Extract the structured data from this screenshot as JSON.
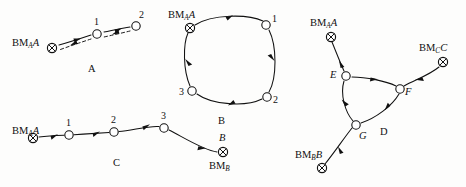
{
  "figure": {
    "width": 466,
    "height": 187,
    "background_color": "#fdfdfc",
    "ink_color": "#111111"
  },
  "panels": [
    {
      "id": "A",
      "caption": "A",
      "caption_pos": [
        90,
        65
      ],
      "description": "Out-and-back traverse: benchmark BM_A A to station 1 to station 2 and returning along a dashed path.",
      "nodes": [
        {
          "name": "bm-a",
          "kind": "benchmark",
          "label": "BM",
          "subscript": "A",
          "suffix": "A",
          "x": 52,
          "y": 48,
          "label_pos": [
            12,
            42
          ],
          "label_anchor": "start"
        },
        {
          "name": "station-1",
          "kind": "station",
          "label": "1",
          "x": 97,
          "y": 34,
          "label_pos": [
            93,
            22
          ],
          "label_anchor": "middle"
        },
        {
          "name": "station-2",
          "kind": "station",
          "label": "2",
          "x": 136,
          "y": 26,
          "label_pos": [
            139,
            16
          ],
          "label_anchor": "start"
        }
      ],
      "edges": [
        {
          "from": "bm-a",
          "to": "station-1",
          "style": "solid",
          "direction": "forward"
        },
        {
          "from": "station-1",
          "to": "station-2",
          "style": "solid",
          "direction": "forward"
        },
        {
          "from": "station-2",
          "to": "station-1",
          "style": "dashed",
          "direction": "forward"
        },
        {
          "from": "station-1",
          "to": "bm-a",
          "style": "dashed",
          "direction": "forward"
        }
      ]
    },
    {
      "id": "B",
      "caption": "B",
      "caption_pos": [
        221,
        122
      ],
      "description": "Closed loop traverse beginning and ending at benchmark BM_A A through stations 1, 2 and 3.",
      "nodes": [
        {
          "name": "bm-a",
          "kind": "benchmark",
          "label": "BM",
          "subscript": "A",
          "suffix": "A",
          "x": 190,
          "y": 28,
          "label_pos": [
            170,
            15
          ],
          "label_anchor": "start"
        },
        {
          "name": "station-1",
          "kind": "station",
          "label": "1",
          "x": 266,
          "y": 25,
          "label_pos": [
            272,
            19
          ],
          "label_anchor": "start"
        },
        {
          "name": "station-2",
          "kind": "station",
          "label": "2",
          "x": 267,
          "y": 97,
          "label_pos": [
            273,
            101
          ],
          "label_anchor": "start"
        },
        {
          "name": "station-3",
          "kind": "station",
          "label": "3",
          "x": 192,
          "y": 91,
          "label_pos": [
            184,
            93
          ],
          "label_anchor": "end"
        }
      ],
      "edges": [
        {
          "from": "bm-a",
          "to": "station-1",
          "style": "solid",
          "direction": "forward"
        },
        {
          "from": "station-1",
          "to": "station-2",
          "style": "solid",
          "direction": "forward"
        },
        {
          "from": "station-2",
          "to": "station-3",
          "style": "solid",
          "direction": "forward"
        },
        {
          "from": "station-3",
          "to": "bm-a",
          "style": "solid",
          "direction": "forward"
        }
      ]
    },
    {
      "id": "C",
      "caption": "C",
      "caption_pos": [
        116,
        166
      ],
      "description": "Open link traverse from benchmark BM_A A through stations 1, 2 and 3 to benchmark B / BM_B.",
      "nodes": [
        {
          "name": "bm-a",
          "kind": "benchmark",
          "label": "BM",
          "subscript": "A",
          "suffix": "A",
          "x": 33,
          "y": 138,
          "label_pos": [
            12,
            131
          ],
          "label_anchor": "start"
        },
        {
          "name": "station-1",
          "kind": "station",
          "label": "1",
          "x": 69,
          "y": 135,
          "label_pos": [
            67,
            124
          ],
          "label_anchor": "middle"
        },
        {
          "name": "station-2",
          "kind": "station",
          "label": "2",
          "x": 114,
          "y": 132,
          "label_pos": [
            112,
            121
          ],
          "label_anchor": "middle"
        },
        {
          "name": "station-3",
          "kind": "station",
          "label": "3",
          "x": 164,
          "y": 128,
          "label_pos": [
            163,
            118
          ],
          "label_anchor": "middle"
        },
        {
          "name": "bm-b",
          "kind": "benchmark",
          "label": "BM",
          "subscript": "B",
          "suffix": "",
          "top_label": "B",
          "x": 223,
          "y": 152,
          "label_pos": [
            210,
            171
          ],
          "label_anchor": "start",
          "top_label_pos": [
            222,
            138
          ]
        }
      ],
      "edges": [
        {
          "from": "bm-a",
          "to": "station-1",
          "style": "solid",
          "direction": "forward"
        },
        {
          "from": "station-1",
          "to": "station-2",
          "style": "solid",
          "direction": "forward"
        },
        {
          "from": "station-2",
          "to": "station-3",
          "style": "solid",
          "direction": "forward"
        },
        {
          "from": "station-3",
          "to": "bm-b",
          "style": "solid",
          "direction": "forward"
        }
      ]
    },
    {
      "id": "D",
      "caption": "D",
      "caption_pos": [
        383,
        128
      ],
      "description": "Network traverse joining benchmarks BM_A A, BM_C C and BM_B B through junction stations E, F and G.",
      "nodes": [
        {
          "name": "bm-a",
          "kind": "benchmark",
          "label": "BM",
          "subscript": "A",
          "suffix": "A",
          "x": 331,
          "y": 37,
          "label_pos": [
            311,
            23
          ],
          "label_anchor": "start"
        },
        {
          "name": "bm-c",
          "kind": "benchmark",
          "label": "BM",
          "subscript": "C",
          "suffix": "C",
          "x": 443,
          "y": 62,
          "label_pos": [
            421,
            48
          ],
          "label_anchor": "start"
        },
        {
          "name": "bm-b",
          "kind": "benchmark",
          "label": "BM",
          "subscript": "B",
          "suffix": "B",
          "x": 322,
          "y": 168,
          "label_pos": [
            297,
            161
          ],
          "label_anchor": "start"
        },
        {
          "name": "station-e",
          "kind": "station",
          "label": "E",
          "x": 346,
          "y": 76,
          "label_pos": [
            337,
            78
          ],
          "label_anchor": "end"
        },
        {
          "name": "station-f",
          "kind": "station",
          "label": "F",
          "x": 400,
          "y": 89,
          "label_pos": [
            405,
            93
          ],
          "label_anchor": "start"
        },
        {
          "name": "station-g",
          "kind": "station",
          "label": "G",
          "x": 356,
          "y": 125,
          "label_pos": [
            360,
            137
          ],
          "label_anchor": "start"
        }
      ],
      "edges": [
        {
          "from": "bm-a",
          "to": "station-e",
          "style": "solid",
          "direction": "forward"
        },
        {
          "from": "station-e",
          "to": "station-f",
          "style": "solid",
          "direction": "forward"
        },
        {
          "from": "bm-c",
          "to": "station-f",
          "style": "solid",
          "direction": "forward"
        },
        {
          "from": "station-e",
          "to": "station-g",
          "style": "solid",
          "direction": "forward"
        },
        {
          "from": "station-g",
          "to": "station-f",
          "style": "solid",
          "direction": "forward"
        },
        {
          "from": "bm-b",
          "to": "station-g",
          "style": "solid",
          "direction": "forward"
        }
      ]
    }
  ],
  "legend_text": {
    "benchmark_symbol": "crossed-circle",
    "station_symbol": "open-circle"
  }
}
